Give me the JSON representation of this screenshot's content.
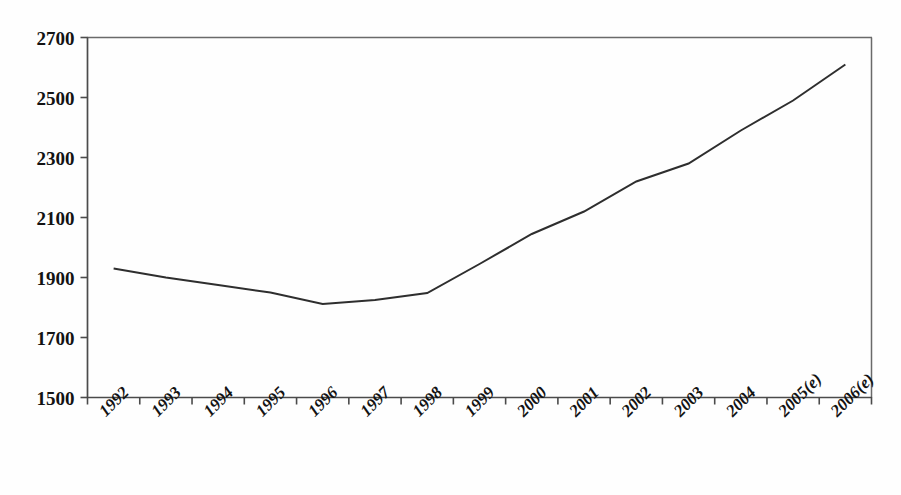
{
  "chart_data": {
    "type": "line",
    "title": "",
    "subtitle": "",
    "xlabel": "",
    "ylabel": "",
    "categories": [
      "1992",
      "1993",
      "1994",
      "1995",
      "1996",
      "1997",
      "1998",
      "1999",
      "2000",
      "2001",
      "2002",
      "2003",
      "2004",
      "2005(e)",
      "2006(e)"
    ],
    "values": [
      1930,
      1900,
      1875,
      1850,
      1812,
      1825,
      1848,
      1945,
      2045,
      2120,
      2220,
      2280,
      2390,
      2490,
      2610
    ],
    "series": [
      {
        "name": "",
        "values": [
          1930,
          1900,
          1875,
          1850,
          1812,
          1825,
          1848,
          1945,
          2045,
          2120,
          2220,
          2280,
          2390,
          2490,
          2610
        ]
      }
    ],
    "ylim": [
      1500,
      2700
    ],
    "yticks": [
      1500,
      1700,
      1900,
      2100,
      2300,
      2500,
      2700
    ],
    "ytick_labels": [
      "1500",
      "1700",
      "1900",
      "2100",
      "2300",
      "2500",
      "2700"
    ],
    "grid": false,
    "legend": false,
    "legend_position": "none",
    "line_color": "#2e2e2e",
    "axis_color": "#4b4b4b",
    "background_color": "#fefefe",
    "xtick_label_rotation": -45,
    "annotations": []
  },
  "axis": {
    "y_min_label": "1500",
    "y_max_label": "2700"
  }
}
